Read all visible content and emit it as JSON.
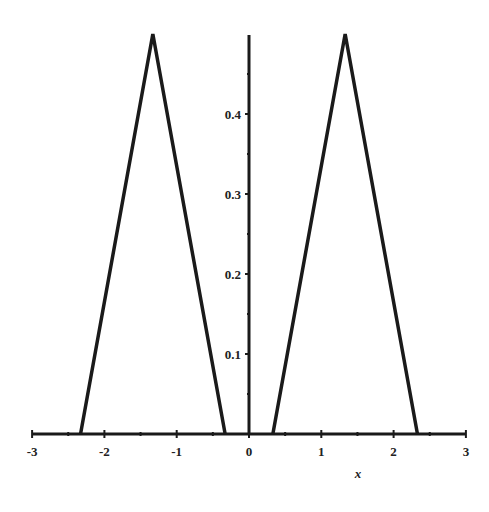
{
  "chart_data": {
    "type": "line",
    "title": "",
    "xlabel": "x",
    "ylabel": "",
    "xlim": [
      -3,
      3
    ],
    "ylim": [
      0,
      0.5
    ],
    "grid": false,
    "legend": null,
    "x_ticks": [
      "-3",
      "-2",
      "-1",
      "0",
      "1",
      "2",
      "3"
    ],
    "y_ticks": [
      "0.1",
      "0.2",
      "0.3",
      "0.4"
    ],
    "series": [
      {
        "name": "left triangle",
        "x": [
          -2.33,
          -1.33,
          -0.33
        ],
        "y": [
          0,
          0.5,
          0
        ]
      },
      {
        "name": "right triangle",
        "x": [
          0.33,
          1.33,
          2.33
        ],
        "y": [
          0,
          0.5,
          0
        ]
      }
    ]
  }
}
